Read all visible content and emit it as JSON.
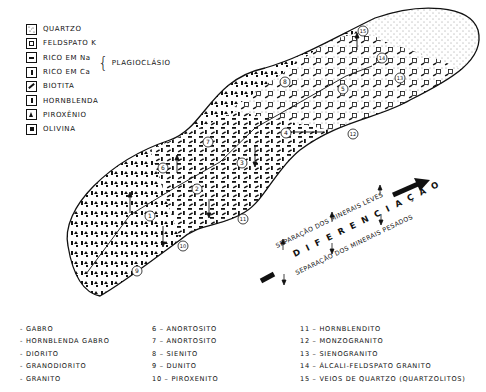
{
  "legend": {
    "items": [
      {
        "symbol": "quartz-dots",
        "label": "QUARTZO"
      },
      {
        "symbol": "open-square",
        "label": "FELDSPATO K"
      },
      {
        "symbol": "horizontal-bar",
        "label": "RICO EM Na"
      },
      {
        "symbol": "vertical-bar",
        "label": "RICO EM Ca"
      },
      {
        "symbol": "diagonal-bar",
        "label": "BIOTITA"
      },
      {
        "symbol": "thin-vertical-bar",
        "label": "HORNBLENDA"
      },
      {
        "symbol": "triangle",
        "label": "PIROXÊNIO"
      },
      {
        "symbol": "filled-square",
        "label": "OLIVINA"
      }
    ],
    "group_label": "PLAGIOCLÁSIO"
  },
  "diagram": {
    "numbered_points": [
      "1",
      "2",
      "3",
      "4",
      "5",
      "6",
      "7",
      "8",
      "9",
      "10",
      "11",
      "12",
      "13",
      "14",
      "15"
    ],
    "arrow_text": {
      "light_minerals": "SEPARAÇÃO DOS MINERAIS LEVES",
      "differentiation": "D I F E R E N C I A Ç Ã O",
      "heavy_minerals": "SEPARAÇÃO DOS MINERAIS PESADOS"
    }
  },
  "rock_list": {
    "col1": [
      "- GABRO",
      "- HORNBLENDA GABRO",
      "- DIORITO",
      "- GRANODIORITO",
      "- GRANITO"
    ],
    "col2": [
      "6 – ANORTOSITO",
      "7 – ANORTOSITO",
      "8 – SIENITO",
      "9 – DUNITO",
      "10 – PIROXENITO"
    ],
    "col3": [
      "11 – HORNBLENDITO",
      "12 – MONZOGRANITO",
      "13 – SIENOGRANITO",
      "14 – ÁLCALI-FELDSPATO GRANITO",
      "15 – VEIOS DE QUARTZO (QUARTZOLITOS)"
    ]
  }
}
